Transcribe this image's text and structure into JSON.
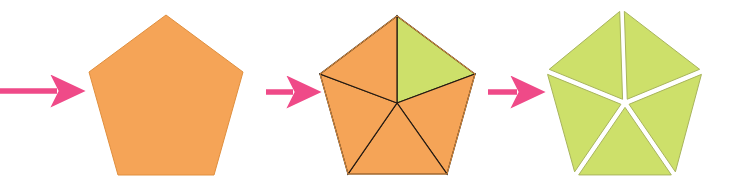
{
  "figure": {
    "width": 746,
    "height": 193,
    "background_color": "#FFFFFF",
    "step_count": 3,
    "arrow_count": 3
  },
  "colors": {
    "orange_fill": "#F5A457",
    "orange_edge": "#E08F3E",
    "green_fill": "#CDE06A",
    "green_edge": "#A8B45C",
    "division_line": "#241A12",
    "arrow_pink": "#EF4A88",
    "gap_white": "#FFFFFF"
  },
  "arrows": [
    {
      "name": "arrow-1",
      "label": "→",
      "shaft_start_x": 0,
      "shaft_end_x": 57,
      "tip_x": 66,
      "y": 91,
      "color": "#EF4A88"
    },
    {
      "name": "arrow-2",
      "label": "→",
      "shaft_start_x": 266,
      "shaft_end_x": 293,
      "tip_x": 302,
      "y": 92,
      "color": "#EF4A88"
    },
    {
      "name": "arrow-3",
      "label": "→",
      "shaft_start_x": 488,
      "shaft_end_x": 517,
      "tip_x": 527,
      "y": 92,
      "color": "#EF4A88"
    }
  ],
  "shapes": [
    {
      "name": "pentagon-whole",
      "step": 1,
      "description": "Solid orange regular pentagon, undivided",
      "center_x": 166,
      "center_y": 103,
      "apex_x": 166,
      "apex_y": 15,
      "vertices": [
        [
          166,
          15
        ],
        [
          243,
          72
        ],
        [
          214,
          175
        ],
        [
          118,
          175
        ],
        [
          89,
          72
        ]
      ],
      "fill": "#F5A457",
      "stroke": "#E08F3E",
      "divided": false,
      "triangle_count": 0,
      "gap": 0
    },
    {
      "name": "pentagon-divided",
      "step": 2,
      "description": "Pentagon split by five radii into five triangles; top-right triangle shaded green",
      "center_x": 397,
      "center_y": 103,
      "apex_x": 397,
      "apex_y": 16,
      "vertices": [
        [
          397,
          16
        ],
        [
          475,
          74
        ],
        [
          447,
          174
        ],
        [
          348,
          174
        ],
        [
          320,
          74
        ]
      ],
      "fill": "#F5A457",
      "stroke": "#E08F3E",
      "divided": true,
      "triangle_count": 5,
      "gap": 0,
      "highlighted_triangle_index": 0,
      "highlight_fill": "#CDE06A",
      "division_line_color": "#241A12"
    },
    {
      "name": "pentagon-exploded",
      "step": 3,
      "description": "Five separated green triangles with white gaps radiating from the centre",
      "center_x": 625,
      "center_y": 103,
      "apex_x": 622,
      "apex_y": 12,
      "vertices": [
        [
          622,
          12
        ],
        [
          700,
          72
        ],
        [
          673,
          173
        ],
        [
          577,
          173
        ],
        [
          549,
          72
        ]
      ],
      "fill": "#CDE06A",
      "stroke": "#A8B45C",
      "divided": true,
      "triangle_count": 5,
      "gap": 5
    }
  ]
}
